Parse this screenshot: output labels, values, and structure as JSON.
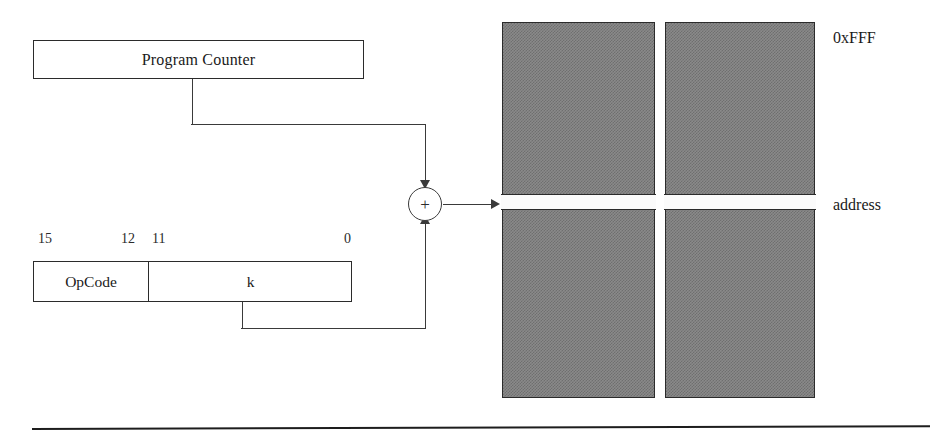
{
  "diagram": {
    "program_counter": {
      "label": "Program Counter"
    },
    "instruction": {
      "fields": [
        {
          "name": "opcode",
          "label": "OpCode"
        },
        {
          "name": "k",
          "label": "k"
        }
      ],
      "bit_labels": [
        {
          "text": "15",
          "bit": 15
        },
        {
          "text": "12",
          "bit": 12
        },
        {
          "text": "11",
          "bit": 11
        },
        {
          "text": "0",
          "bit": 0
        }
      ]
    },
    "adder": {
      "symbol": "+"
    },
    "memory": {
      "blocks": [
        {
          "name": "memory-block-left"
        },
        {
          "name": "memory-block-right"
        }
      ],
      "top_label": "0xFFF",
      "address_label": "address"
    },
    "colors": {
      "memory_fill": "#8a8a8a",
      "memory_fill_dither": "#6f6f6f",
      "stroke": "#2b2b2b",
      "wire": "#3a3a3a",
      "background": "#ffffff",
      "address_row": "#fbfbfb"
    }
  }
}
